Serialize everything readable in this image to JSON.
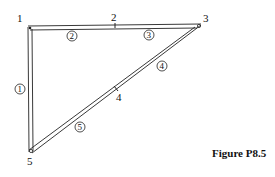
{
  "figure": {
    "caption": "Figure P8.5",
    "nodes": [
      {
        "id": "1",
        "label": "1"
      },
      {
        "id": "2",
        "label": "2"
      },
      {
        "id": "3",
        "label": "3"
      },
      {
        "id": "4",
        "label": "4"
      },
      {
        "id": "5",
        "label": "5"
      }
    ],
    "elements": [
      {
        "id": "1",
        "label": "1",
        "from": "1",
        "to": "5"
      },
      {
        "id": "2",
        "label": "2",
        "from": "1",
        "to": "2"
      },
      {
        "id": "3",
        "label": "3",
        "from": "2",
        "to": "3"
      },
      {
        "id": "4",
        "label": "4",
        "from": "3",
        "to": "4"
      },
      {
        "id": "5",
        "label": "5",
        "from": "4",
        "to": "5"
      }
    ]
  }
}
